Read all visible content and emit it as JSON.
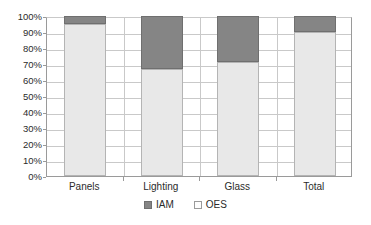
{
  "chart_data": {
    "type": "bar",
    "subtype": "stacked-percent-column",
    "title": "",
    "xlabel": "",
    "ylabel": "",
    "categories": [
      "Panels",
      "Lighting",
      "Glass",
      "Total"
    ],
    "series": [
      {
        "name": "OES",
        "values": [
          95,
          67,
          71,
          90
        ],
        "color": "#e8e8e8"
      },
      {
        "name": "IAM",
        "values": [
          5,
          33,
          29,
          10
        ],
        "color": "#858585"
      }
    ],
    "stack_order": [
      "OES",
      "IAM"
    ],
    "ylim": [
      0,
      100
    ],
    "ytick_values": [
      0,
      10,
      20,
      30,
      40,
      50,
      60,
      70,
      80,
      90,
      100
    ],
    "ytick_labels": [
      "0%",
      "10%",
      "20%",
      "30%",
      "40%",
      "50%",
      "60%",
      "70%",
      "80%",
      "90%",
      "100%"
    ],
    "grid": true,
    "grid_axis": "y",
    "legend": [
      "IAM",
      "OES"
    ],
    "legend_position": "bottom"
  },
  "legend": {
    "items": [
      {
        "label": "IAM",
        "color": "#858585"
      },
      {
        "label": "OES",
        "color": "#e8e8e8"
      }
    ]
  }
}
